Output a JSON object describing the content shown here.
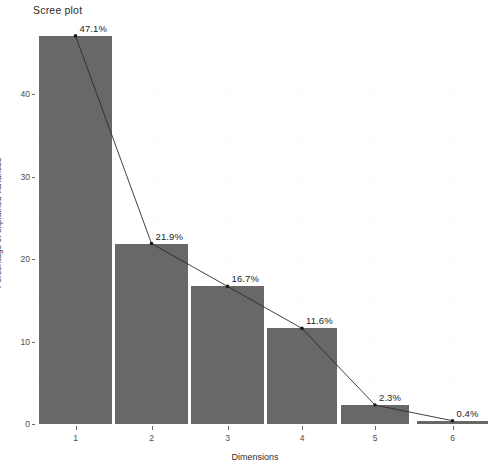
{
  "chart_data": {
    "type": "bar",
    "title": "Scree plot",
    "xlabel": "Dimensions",
    "ylabel": "Percentage of explained variances",
    "categories": [
      "1",
      "2",
      "3",
      "4",
      "5",
      "6"
    ],
    "values": [
      47.1,
      21.9,
      16.7,
      11.6,
      2.3,
      0.4
    ],
    "data_labels": [
      "47.1%",
      "21.9%",
      "16.7%",
      "11.6%",
      "2.3%",
      "0.4%"
    ],
    "ylim": [
      0,
      48
    ],
    "y_ticks": [
      0,
      10,
      20,
      30,
      40
    ],
    "y_tick_labels": [
      "0",
      "10",
      "20",
      "30",
      "40"
    ],
    "x_ticks": [
      1,
      2,
      3,
      4,
      5,
      6
    ],
    "grid": true,
    "legend": "none",
    "series": [
      {
        "name": "Percentage of explained variances",
        "values": [
          47.1,
          21.9,
          16.7,
          11.6,
          2.3,
          0.4
        ],
        "bar_color": "#686868",
        "line_color": "#2b2b2b",
        "point_color": "#1a1a1a"
      }
    ],
    "overlay": {
      "type": "line",
      "label": "variance-trend-line",
      "has_points": true
    },
    "colors": {
      "bar_fill": "#686868",
      "line": "#2b2b2b",
      "point": "#1a1a1a",
      "background": "#ffffff",
      "grid": "#fbfbfb",
      "axis_text": "#4d4d4d",
      "title_text": "#2b2b2b"
    }
  },
  "plot_geometry": {
    "panel_left": 36,
    "panel_top": 20,
    "panel_width": 452,
    "panel_height": 406,
    "bar_left_px": [
      3,
      79,
      155,
      231,
      305,
      381
    ],
    "bar_width_px": [
      73,
      73,
      73,
      70,
      68,
      71
    ],
    "px_per_unit": 8.24,
    "baseline_px": 404
  }
}
